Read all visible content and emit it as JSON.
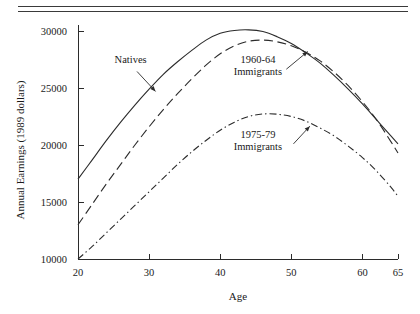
{
  "figure": {
    "name": "annual-earnings-by-age-figure",
    "top_rule": "double-rule",
    "background_color": "#ffffff",
    "ink_color": "#2b2b2b"
  },
  "chart_data": {
    "type": "line",
    "title": "",
    "xlabel": "Age",
    "ylabel": "Annual Earnings (1989 dollars)",
    "xlim": [
      20,
      65
    ],
    "ylim": [
      10000,
      30500
    ],
    "grid": false,
    "legend_position": "inline-annotations",
    "xticks": [
      20,
      30,
      40,
      50,
      60,
      65
    ],
    "xticklabels": [
      "20",
      "30",
      "40",
      "50",
      "60",
      "65"
    ],
    "yticks": [
      10000,
      15000,
      20000,
      25000,
      30000
    ],
    "yticklabels": [
      "10000",
      "15000",
      "20000",
      "25000",
      "30000"
    ],
    "x": [
      20,
      22,
      24,
      26,
      28,
      30,
      32,
      34,
      36,
      38,
      40,
      42,
      44,
      46,
      48,
      50,
      52,
      54,
      56,
      58,
      60,
      62,
      64,
      65
    ],
    "series": [
      {
        "name": "Natives",
        "style": "solid",
        "values": [
          17000,
          18700,
          20400,
          22000,
          23500,
          24900,
          26200,
          27300,
          28300,
          29200,
          29800,
          30050,
          30100,
          29950,
          29500,
          28900,
          28100,
          27200,
          26100,
          24900,
          23600,
          22200,
          20800,
          20100
        ]
      },
      {
        "name": "1960-64 Immigrants",
        "style": "long-dash",
        "values": [
          13000,
          14800,
          16600,
          18300,
          20000,
          21600,
          23100,
          24500,
          25800,
          27000,
          28000,
          28700,
          29100,
          29200,
          29050,
          28700,
          28150,
          27400,
          26400,
          25200,
          23800,
          22200,
          20300,
          19300
        ]
      },
      {
        "name": "1975-79 Immigrants",
        "style": "dash-dot",
        "values": [
          10000,
          11100,
          12300,
          13500,
          14700,
          15900,
          17100,
          18300,
          19400,
          20400,
          21300,
          22000,
          22500,
          22720,
          22700,
          22500,
          22100,
          21500,
          20800,
          19900,
          18900,
          17700,
          16300,
          15500
        ]
      }
    ],
    "annotations": [
      {
        "id": "natives-label",
        "text_lines": [
          "Natives"
        ],
        "text_x": 27.4,
        "text_y": 27150,
        "arrow_from_x": 28.3,
        "arrow_from_y": 26450,
        "arrow_to_x": 30.9,
        "arrow_to_y": 24700
      },
      {
        "id": "immigrants-1960-64-label",
        "text_lines": [
          "1960-64",
          "Immigrants"
        ],
        "text_x": 45.3,
        "text_y": 27200,
        "arrow_from_x": 49.3,
        "arrow_from_y": 26650,
        "arrow_to_x": 52.3,
        "arrow_to_y": 28200
      },
      {
        "id": "immigrants-1975-79-label",
        "text_lines": [
          "1975-79",
          "Immigrants"
        ],
        "text_x": 45.3,
        "text_y": 20650,
        "arrow_from_x": 50.3,
        "arrow_from_y": 20100,
        "arrow_to_x": 52.6,
        "arrow_to_y": 21650
      }
    ]
  }
}
